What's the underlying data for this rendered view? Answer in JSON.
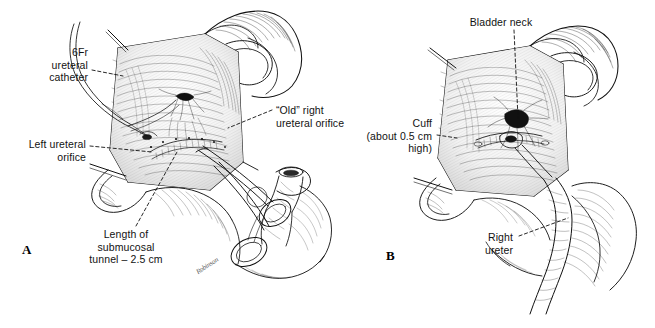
{
  "figure": {
    "background_color": "#ffffff",
    "ink_color": "#111111",
    "type": "medical-line-illustration"
  },
  "panels": [
    {
      "id": "A",
      "letter": "A",
      "labels": [
        {
          "name": "label-6fr-ureteral-catheter",
          "text": "6Fr\nureteral\ncatheter",
          "align": "right",
          "x": 16,
          "y": 46,
          "width": 72,
          "leader": {
            "from_x": 92,
            "from_y": 70,
            "to_x": 123,
            "to_y": 76
          }
        },
        {
          "name": "label-left-ureteral-orifice",
          "text": "Left ureteral\norifice",
          "align": "right",
          "x": 8,
          "y": 138,
          "width": 78,
          "leader": {
            "from_x": 90,
            "from_y": 146,
            "to_x": 152,
            "to_y": 152
          }
        },
        {
          "name": "label-old-right-ureteral-orifice",
          "text": "“Old” right\nureteral orifice",
          "align": "left",
          "x": 276,
          "y": 104,
          "width": 92,
          "leader": {
            "from_x": 272,
            "from_y": 110,
            "to_x": 228,
            "to_y": 128
          }
        },
        {
          "name": "label-length-of-submucosal-tunnel",
          "text": "Length of\nsubmucosal\ntunnel – 2.5 cm",
          "align": "center",
          "x": 80,
          "y": 228,
          "width": 92,
          "leader": {
            "from_x": 136,
            "from_y": 226,
            "to_x": 177,
            "to_y": 152
          }
        }
      ],
      "signature": "Robinson"
    },
    {
      "id": "B",
      "letter": "B",
      "labels": [
        {
          "name": "label-bladder-neck",
          "text": "Bladder neck",
          "align": "center",
          "x": 462,
          "y": 16,
          "width": 78,
          "leader": {
            "from_x": 514,
            "from_y": 30,
            "to_x": 518,
            "to_y": 118
          }
        },
        {
          "name": "label-cuff-about-half-cm-high",
          "text": "Cuff\n(about 0.5 cm\nhigh)",
          "align": "right",
          "x": 350,
          "y": 117,
          "width": 82,
          "leader": {
            "from_x": 437,
            "from_y": 135,
            "to_x": 457,
            "to_y": 138
          }
        },
        {
          "name": "label-right-ureter",
          "text": "Right\nureter",
          "align": "right",
          "x": 463,
          "y": 231,
          "width": 50,
          "leader": {
            "from_x": 519,
            "from_y": 236,
            "to_x": 568,
            "to_y": 218
          }
        }
      ]
    }
  ],
  "panel_letters": [
    {
      "name": "panel-letter-a",
      "text": "A",
      "x": 22,
      "y": 242
    },
    {
      "name": "panel-letter-b",
      "text": "B",
      "x": 386,
      "y": 248
    }
  ]
}
